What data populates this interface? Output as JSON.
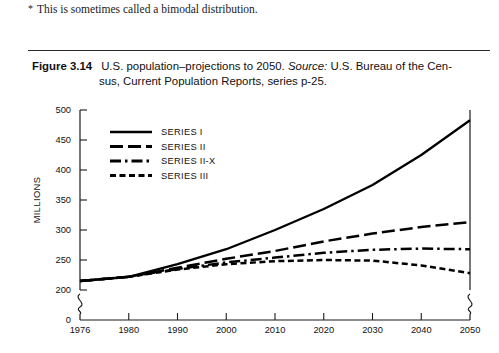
{
  "footnote": {
    "marker": "*",
    "text": "This is sometimes called a bimodal distribution."
  },
  "caption": {
    "figure_label": "Figure 3.14",
    "line1_a": "U.S. population–projections to 2050.",
    "source_label": "Source:",
    "line1_b": "U.S. Bureau of the Cen-",
    "line2": "sus, Current Population Reports, series p-25."
  },
  "chart_data": {
    "type": "line",
    "title": "",
    "xlabel": "",
    "ylabel": "MILLIONS",
    "xlim": [
      1976,
      2050
    ],
    "ylim": [
      200,
      500
    ],
    "y_axis_break": true,
    "y_break_base": 0,
    "grid": false,
    "legend_position": "top-left",
    "xticks": [
      1976,
      1980,
      1990,
      2000,
      2010,
      2020,
      2030,
      2040,
      2050
    ],
    "yticks": [
      0,
      200,
      250,
      300,
      350,
      400,
      450,
      500
    ],
    "x": [
      1976,
      1980,
      1990,
      2000,
      2010,
      2020,
      2030,
      2040,
      2050
    ],
    "series": [
      {
        "name": "SERIES I",
        "style": "solid",
        "values": [
          215,
          222,
          243,
          268,
          300,
          335,
          375,
          425,
          483
        ]
      },
      {
        "name": "SERIES II",
        "style": "dashed",
        "values": [
          215,
          222,
          237,
          252,
          265,
          281,
          294,
          305,
          313
        ]
      },
      {
        "name": "SERIES II-X",
        "style": "dashdot",
        "values": [
          215,
          222,
          235,
          246,
          254,
          262,
          267,
          269,
          268
        ]
      },
      {
        "name": "SERIES III",
        "style": "dotted",
        "values": [
          215,
          222,
          234,
          243,
          248,
          250,
          249,
          241,
          228
        ]
      }
    ]
  }
}
